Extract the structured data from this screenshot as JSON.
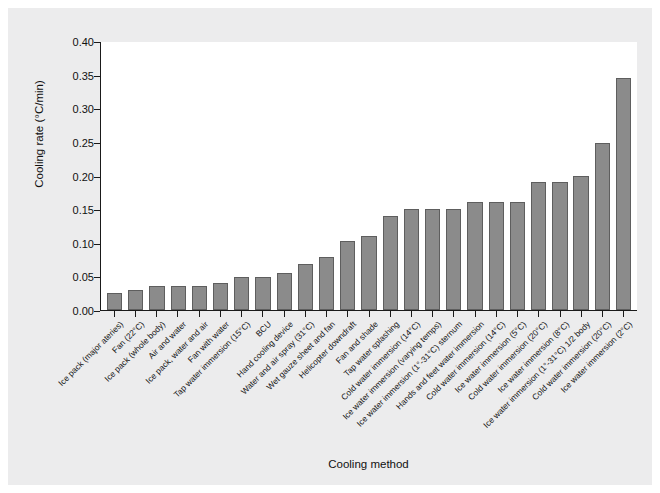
{
  "chart_data": {
    "type": "bar",
    "title": "",
    "xlabel": "Cooling method",
    "ylabel": "Cooling rate (°C/min)",
    "ylim": [
      0.0,
      0.4
    ],
    "yticks": [
      "0.00",
      "0.05",
      "0.10",
      "0.15",
      "0.20",
      "0.25",
      "0.30",
      "0.35",
      "0.40"
    ],
    "ytick_values": [
      0.0,
      0.05,
      0.1,
      0.15,
      0.2,
      0.25,
      0.3,
      0.35,
      0.4
    ],
    "grid": false,
    "legend": "none",
    "bar_color": "#8b8b8b",
    "bar_edge_color": "#5e5e5e",
    "plot_background": "#ffffff",
    "figure_background": "#ececed",
    "categories": [
      "Ice pack (major ateries)",
      "Fan (22°C)",
      "Ice pack (whole body)",
      "Air and water",
      "Ice pack, water and air",
      "Fan with water",
      "Tap water immersion (15°C)",
      "BCU",
      "Hand cooling device",
      "Water and air spray (31°C)",
      "Wet gauze sheet and fan",
      "Helicopter downdraft",
      "Fan and shade",
      "Tap water splashing",
      "Cold water immersion (14°C)",
      "Ice water immersion (varying temps)",
      "Ice water immersion (1°-31°C) sternum",
      "Hands and feet water immersion",
      "Cold water immersion (14°C)",
      "Ice water immersion (5°C)",
      "Cold water immersion (20°C)",
      "Ice water immersion (8°C)",
      "Ice water immersion (1°-31°C) 1/2 body",
      "Cold water immersion (20°C)",
      "Ice water immersion (2°C)"
    ],
    "values": [
      0.025,
      0.03,
      0.035,
      0.035,
      0.035,
      0.04,
      0.049,
      0.049,
      0.055,
      0.069,
      0.079,
      0.103,
      0.11,
      0.14,
      0.15,
      0.15,
      0.15,
      0.16,
      0.16,
      0.16,
      0.19,
      0.19,
      0.2,
      0.249,
      0.345
    ]
  }
}
